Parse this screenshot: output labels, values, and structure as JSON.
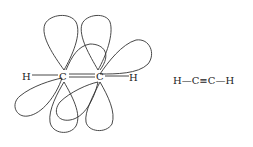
{
  "diagram": {
    "orbital_labels": {
      "h_left": "H",
      "c_left": "C",
      "c_right": "C",
      "h_right": "H"
    },
    "structural_formula": "H—C≡C—H"
  }
}
